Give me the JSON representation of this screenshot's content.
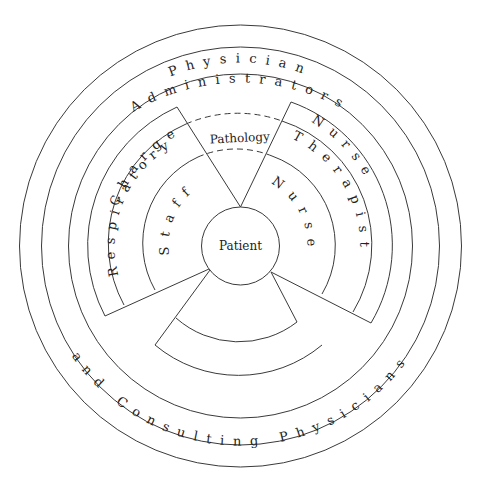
{
  "diagram": {
    "title": "",
    "center_label": "Patient",
    "rings": {
      "outer_top": "Administrators",
      "outer_bottom": "and Consulting Physicians",
      "second": "Physician",
      "left_outer": "Charge",
      "left_inner": "Respiratory",
      "left_core": "Staff",
      "top_center": "Pathology",
      "right_outer": "Nurse",
      "right_inner": "Therapist",
      "right_core": "Nurse"
    },
    "colors": {
      "stroke": "#3a3a3a",
      "text": "#222222",
      "background": "#ffffff"
    }
  }
}
